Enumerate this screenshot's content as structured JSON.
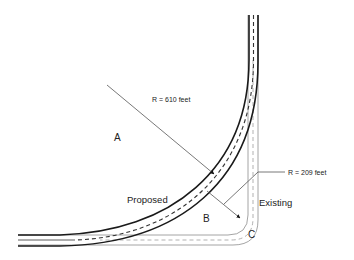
{
  "diagram": {
    "title": "",
    "labels": {
      "zone_a": "A",
      "zone_b": "B",
      "zone_c": "C",
      "proposed": "Proposed",
      "existing": "Existing",
      "radius_proposed": "R = 610 feet",
      "radius_existing": "R = 209 feet"
    },
    "roads": [
      {
        "name": "Proposed",
        "radius_feet": 610,
        "style": "heavy black edges with dashed centerline"
      },
      {
        "name": "Existing",
        "radius_feet": 209,
        "style": "thin gray edges with dashed centerline"
      }
    ],
    "colors": {
      "proposed_edge": "#1a1a1a",
      "proposed_center": "#333333",
      "existing_edge": "#9a9a9a",
      "existing_center": "#a8a8a8",
      "leader": "#555555"
    }
  }
}
